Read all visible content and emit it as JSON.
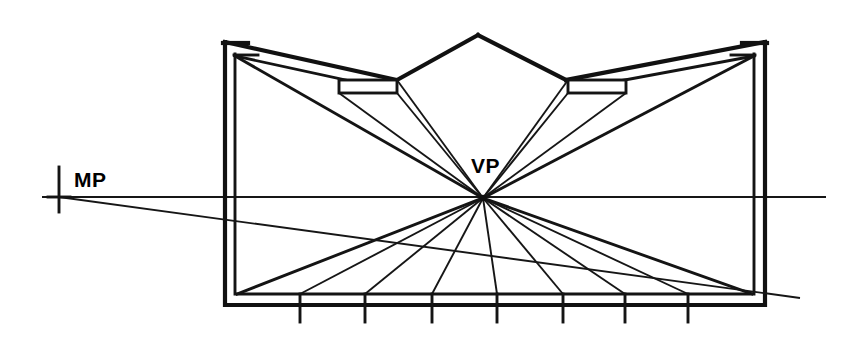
{
  "diagram": {
    "background_color": "#ffffff",
    "line_color": "#111111",
    "width": 856,
    "height": 340,
    "labels": {
      "vanishing_point": "VP",
      "measuring_point": "MP"
    },
    "points": {
      "vanishing_point": {
        "x": 483,
        "y": 198
      },
      "measuring_point": {
        "x": 59,
        "y": 197
      },
      "roof_apex": {
        "x": 478,
        "y": 35
      }
    },
    "horizon": {
      "y": 197,
      "x_start": 42,
      "x_end": 826
    },
    "outer_frame": {
      "left_outer": 225,
      "left_inner": 235,
      "right_inner": 754,
      "right_outer": 765,
      "top": 42,
      "bottom_inner": 295,
      "bottom_outer": 305
    },
    "baseline_ticks": [
      {
        "x": 300
      },
      {
        "x": 365
      },
      {
        "x": 432
      },
      {
        "x": 497
      },
      {
        "x": 563
      },
      {
        "x": 625
      },
      {
        "x": 688
      }
    ],
    "tick_bottom_y": 322,
    "floor_rays": [
      {
        "to_x": 237,
        "to_y": 294
      },
      {
        "to_x": 300,
        "to_y": 294
      },
      {
        "to_x": 365,
        "to_y": 294
      },
      {
        "to_x": 432,
        "to_y": 294
      },
      {
        "to_x": 497,
        "to_y": 294
      },
      {
        "to_x": 563,
        "to_y": 294
      },
      {
        "to_x": 625,
        "to_y": 294
      },
      {
        "to_x": 688,
        "to_y": 294
      },
      {
        "to_x": 752,
        "to_y": 294
      }
    ],
    "mp_line": {
      "from_x": 59,
      "from_y": 197,
      "to_x": 800,
      "to_y": 298
    },
    "mp_marker": {
      "cx": 59,
      "cy": 197,
      "arm_h": 22,
      "arm_v": 30
    },
    "ceiling_beams": [
      {
        "side": "left",
        "x1": 339,
        "y1": 85,
        "x2": 394,
        "y2": 85,
        "depth": 11
      },
      {
        "side": "right",
        "x1": 568,
        "y1": 85,
        "x2": 624,
        "y2": 85,
        "depth": 11
      }
    ],
    "label_positions": {
      "vp_label": {
        "x": 471,
        "y": 173
      },
      "mp_label": {
        "x": 74,
        "y": 187
      }
    }
  }
}
